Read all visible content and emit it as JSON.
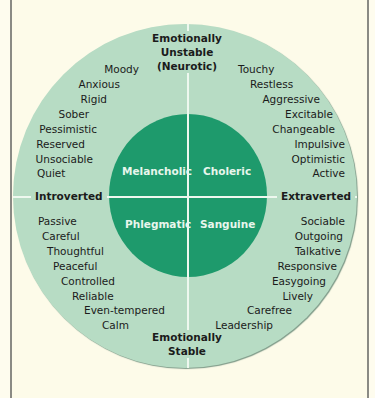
{
  "diagram": {
    "type": "personality-temperament-wheel",
    "axes": {
      "top": [
        "Emotionally",
        "Unstable",
        "(Neurotic)"
      ],
      "bottom": [
        "Emotionally",
        "Stable"
      ],
      "left": "Introverted",
      "right": "Extraverted"
    },
    "temperaments": {
      "top_left": "Melancholic",
      "top_right": "Choleric",
      "bottom_left": "Phlegmatic",
      "bottom_right": "Sanguine"
    },
    "traits": {
      "top_left": [
        "Moody",
        "Anxious",
        "Rigid",
        "Sober",
        "Pessimistic",
        "Reserved",
        "Unsociable",
        "Quiet"
      ],
      "top_right": [
        "Touchy",
        "Restless",
        "Aggressive",
        "Excitable",
        "Changeable",
        "Impulsive",
        "Optimistic",
        "Active"
      ],
      "bottom_left": [
        "Passive",
        "Careful",
        "Thoughtful",
        "Peaceful",
        "Controlled",
        "Reliable",
        "Even-tempered",
        "Calm"
      ],
      "bottom_right": [
        "Sociable",
        "Outgoing",
        "Talkative",
        "Responsive",
        "Easygoing",
        "Lively",
        "Carefree",
        "Leadership"
      ]
    },
    "colors": {
      "outer_circle": "#b7dcc4",
      "inner_circle": "#1e9a6c",
      "background": "#fdfbe9",
      "divider": "#eef8ef"
    }
  }
}
